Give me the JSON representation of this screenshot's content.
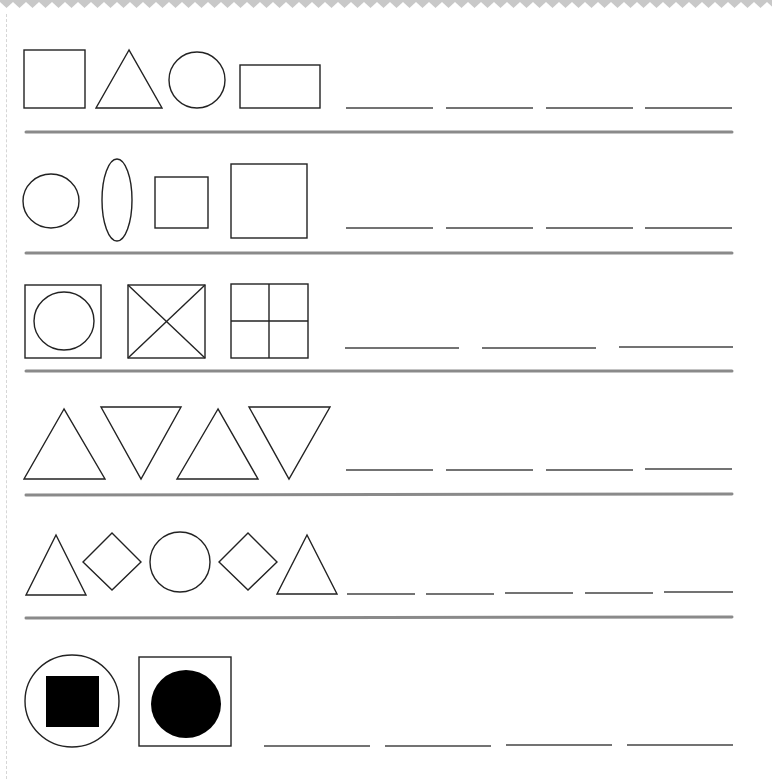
{
  "worksheet": {
    "title": "Shape pattern worksheet",
    "colors": {
      "zigzag": "#c8c8c8",
      "shape_stroke": "#222222",
      "shape_fill": "#000000",
      "blank_line": "#444444",
      "divider": "#8a8a8a",
      "background": "#ffffff"
    },
    "rows": [
      {
        "index": 1,
        "description": "square, triangle, circle, rectangle",
        "shapes": [
          "square",
          "triangle",
          "circle",
          "rectangle"
        ],
        "blank_count": 4
      },
      {
        "index": 2,
        "description": "circle, ellipse, small square, large square",
        "shapes": [
          "circle",
          "ellipse",
          "small-square",
          "large-square"
        ],
        "blank_count": 4
      },
      {
        "index": 3,
        "description": "square with circle, square with X, square divided in four",
        "shapes": [
          "square-with-circle",
          "square-with-x",
          "square-quartered"
        ],
        "blank_count": 3
      },
      {
        "index": 4,
        "description": "triangle up, triangle down, triangle up, triangle down",
        "shapes": [
          "triangle-up",
          "triangle-down",
          "triangle-up",
          "triangle-down"
        ],
        "blank_count": 4
      },
      {
        "index": 5,
        "description": "triangle, diamond, circle, diamond, triangle",
        "shapes": [
          "triangle",
          "diamond",
          "circle",
          "diamond",
          "triangle"
        ],
        "blank_count": 5
      },
      {
        "index": 6,
        "description": "circle with filled square, square with filled circle",
        "shapes": [
          "circle-with-filled-square",
          "square-with-filled-circle"
        ],
        "blank_count": 4
      }
    ]
  }
}
